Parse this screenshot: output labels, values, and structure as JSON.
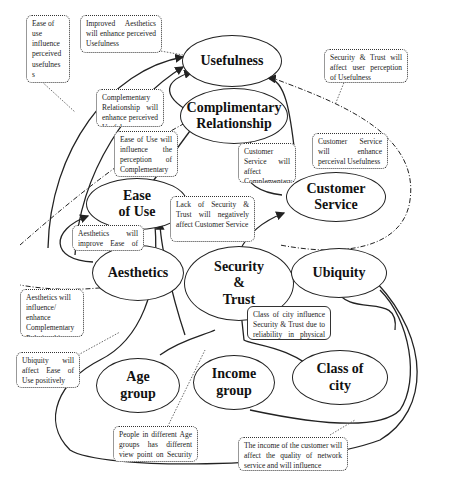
{
  "nodes": {
    "usefulness": "Usefulness",
    "complimentary_relationship": "Complimentary\nRelationship",
    "customer_service": "Customer\nService",
    "ease_of_use": "Ease\nof Use",
    "aesthetics": "Aesthetics",
    "security_trust": "Security\n&\nTrust",
    "ubiquity": "Ubiquity",
    "age_group": "Age\ngroup",
    "income_group": "Income\ngroup",
    "class_of_city": "Class of\ncity"
  },
  "notes": {
    "ease_use_usefulness": "Ease of use influence perceived usefulnes s",
    "aesthetics_usefulness": "Improved Aesthetics will enhance perceived Usefulness",
    "security_usefulness": "Security & Trust will affect user perception of Usefulness",
    "complementary_usefulness": "Complementary Relationship will enhance perceived Usefulness",
    "ease_use_complementary": "Ease of Use will influence the perception of Complementary Relationship",
    "customer_service_complementary": "Customer Service will affect Complementary Relationship",
    "customer_service_usefulness": "Customer Service will enhance perceival Usefulness",
    "security_customer_service": "Lack of Security & Trust will negatively affect Customer Service",
    "aesthetics_ease_use": "Aesthetics will improve Ease of Use",
    "aesthetics_complementary": "Aesthetics will influence/ enhance Complementary Relationship",
    "class_city_security": "Class of city influence Security & Trust due to reliability in physical cash",
    "ubiquity_ease_use": "Ubiquity will affect Ease of Use positively",
    "age_security": "People in different Age groups has different view point on Security &",
    "income_network": "The income of the customer will affect the quality of network service and will influence"
  },
  "colors": {
    "line": "#222222",
    "background": "#ffffff"
  }
}
